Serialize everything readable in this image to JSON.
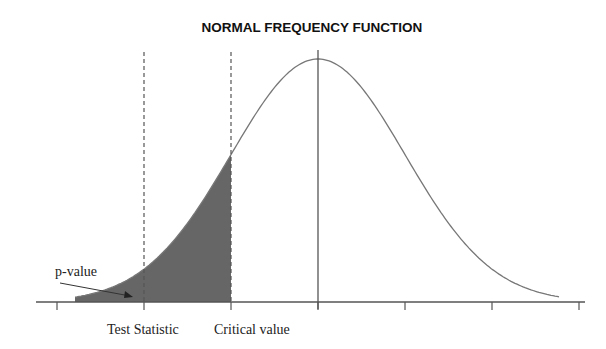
{
  "title": "NORMAL FREQUENCY FUNCTION",
  "labels": {
    "p_value": "p-value",
    "test_statistic": "Test Statistic",
    "critical_value": "Critical value"
  },
  "colors": {
    "curve": "#777777",
    "shade": "#666666",
    "axis": "#555555"
  },
  "chart_data": {
    "type": "area",
    "title": "NORMAL FREQUENCY FUNCTION",
    "xlabel": "",
    "ylabel": "",
    "x_ticks_sd": [
      -3,
      -2,
      -1,
      0,
      1,
      2,
      3
    ],
    "mean": 0,
    "test_statistic_sd": -2,
    "critical_value_sd": -1,
    "shaded_region": "x <= critical value",
    "annotations": [
      "p-value",
      "Test Statistic",
      "Critical value"
    ],
    "grid": false
  }
}
